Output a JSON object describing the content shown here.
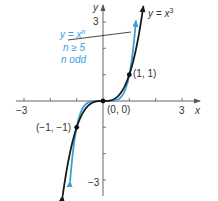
{
  "chart_data": {
    "type": "line",
    "title": "",
    "xlabel": "x",
    "ylabel": "y",
    "xlim": [
      -3,
      3
    ],
    "ylim": [
      -3,
      3
    ],
    "x_ticks": [
      -3,
      -2,
      -1,
      1,
      2,
      3
    ],
    "y_ticks": [
      -3,
      -2,
      -1,
      1,
      2,
      3
    ],
    "x_tick_labels": [
      "-3",
      "3"
    ],
    "y_tick_labels": [
      "3",
      "-3"
    ],
    "grid": false,
    "series": [
      {
        "name": "y = x^3",
        "color": "#1a1a1a",
        "function": "x^3"
      },
      {
        "name": "y = x^n, n ≥ 5, n odd",
        "color": "#3aa0d8",
        "function": "x^5"
      }
    ],
    "points": [
      {
        "label": "(-1, -1)",
        "x": -1,
        "y": -1
      },
      {
        "label": "(0, 0)",
        "x": 0,
        "y": 0
      },
      {
        "label": "(1, 1)",
        "x": 1,
        "y": 1
      }
    ],
    "annotations": [
      {
        "text": "y = x^3",
        "color": "#1a1a1a"
      },
      {
        "text": "y = x^n",
        "color": "#3aa0d8"
      },
      {
        "text": "n ≥ 5",
        "color": "#3aa0d8"
      },
      {
        "text": "n odd",
        "color": "#3aa0d8"
      }
    ]
  },
  "labels": {
    "x_axis": "x",
    "y_axis": "y",
    "x_neg3": "−3",
    "x_pos3": "3",
    "y_pos3": "3",
    "y_neg3": "−3",
    "pt_neg": "(−1, −1)",
    "pt_origin": "(0, 0)",
    "pt_pos": "(1, 1)",
    "cubic_y": "y = x",
    "cubic_exp": "3",
    "blue_line1_y": "y = x",
    "blue_line1_exp": "n",
    "blue_line2": "n ≥ 5",
    "blue_line3": "n odd"
  }
}
